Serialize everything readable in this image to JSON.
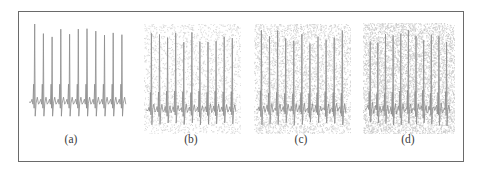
{
  "figure": {
    "panels": [
      {
        "id": "a",
        "label": "(a)",
        "noise_level": 0.0,
        "x": 27,
        "y": 18,
        "w": 104,
        "h": 108,
        "caption_x": 51,
        "caption_y": 135
      },
      {
        "id": "b",
        "label": "(b)",
        "noise_level": 0.35,
        "x": 144,
        "y": 24,
        "w": 97,
        "h": 110,
        "caption_x": 172,
        "caption_y": 135
      },
      {
        "id": "c",
        "label": "(c)",
        "noise_level": 0.6,
        "x": 254,
        "y": 24,
        "w": 97,
        "h": 110,
        "caption_x": 283,
        "caption_y": 135
      },
      {
        "id": "d",
        "label": "(d)",
        "noise_level": 0.85,
        "x": 363,
        "y": 23,
        "w": 92,
        "h": 111,
        "caption_x": 389,
        "caption_y": 135
      }
    ],
    "colors": {
      "signal": "#8c8c8c",
      "noise": "#9a9a9a",
      "frame": "#6a6a6a",
      "caption": "#3a3a3a"
    }
  },
  "chart_data": {
    "type": "line",
    "title": "",
    "panels": [
      "(a)",
      "(b)",
      "(c)",
      "(d)"
    ],
    "beats_per_panel": 11,
    "noise_levels": [
      "none",
      "low",
      "medium",
      "high"
    ],
    "xlabel": "",
    "ylabel": "",
    "grid": false,
    "legend": "none"
  }
}
